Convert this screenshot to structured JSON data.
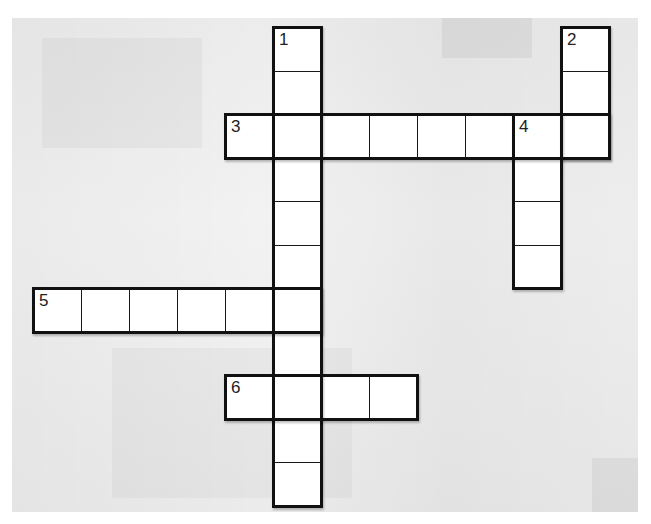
{
  "puzzle": {
    "type": "crossword",
    "grid": {
      "origin_x": 33,
      "origin_y": 27,
      "cell_width": 48,
      "cell_height": 43.5,
      "columns": 12,
      "rows": 11
    },
    "words": [
      {
        "number": "1",
        "direction": "down",
        "row": 0,
        "col": 5,
        "length": 11
      },
      {
        "number": "2",
        "direction": "down",
        "row": 0,
        "col": 11,
        "length": 3
      },
      {
        "number": "3",
        "direction": "across",
        "row": 2,
        "col": 4,
        "length": 8
      },
      {
        "number": "4",
        "direction": "down",
        "row": 2,
        "col": 10,
        "length": 4
      },
      {
        "number": "5",
        "direction": "across",
        "row": 6,
        "col": 0,
        "length": 6
      },
      {
        "number": "6",
        "direction": "across",
        "row": 8,
        "col": 4,
        "length": 4
      }
    ],
    "clue_numbers": [
      "1",
      "2",
      "3",
      "4",
      "5",
      "6"
    ]
  },
  "colors": {
    "cell_fill": "#ffffff",
    "border": "#111111",
    "background": "#efefef"
  }
}
